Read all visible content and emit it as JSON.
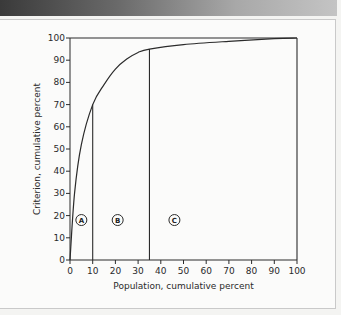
{
  "chart_data": {
    "type": "line",
    "title": "",
    "xlabel": "Population, cumulative percent",
    "ylabel": "Criterion, cumulative percent",
    "xlim": [
      0,
      100
    ],
    "ylim": [
      0,
      100
    ],
    "x_ticks": [
      0,
      10,
      20,
      30,
      40,
      50,
      60,
      70,
      80,
      90,
      100
    ],
    "y_ticks": [
      0,
      10,
      20,
      30,
      40,
      50,
      60,
      70,
      80,
      90,
      100
    ],
    "grid": false,
    "legend": "none",
    "series": [
      {
        "name": "Cumulative criterion curve",
        "x": [
          0,
          2,
          5,
          10,
          15,
          20,
          25,
          30,
          35,
          50,
          70,
          90,
          100
        ],
        "y": [
          0,
          30,
          52,
          70,
          79,
          86,
          90.5,
          93.5,
          95,
          97,
          98.5,
          99.7,
          100
        ]
      }
    ],
    "reference_lines": [
      {
        "type": "vertical",
        "x": 10,
        "y_top": 70
      },
      {
        "type": "vertical",
        "x": 35,
        "y_top": 95
      },
      {
        "type": "horizontal",
        "y": 100,
        "x_from": 0,
        "x_to": 100
      },
      {
        "type": "vertical",
        "x": 100,
        "y_from": 0,
        "y_to": 100
      }
    ],
    "annotations": [
      {
        "label": "A",
        "x": 5,
        "y": 18,
        "shape": "circle"
      },
      {
        "label": "B",
        "x": 21,
        "y": 18,
        "shape": "circle"
      },
      {
        "label": "C",
        "x": 46,
        "y": 18,
        "shape": "circle"
      }
    ]
  },
  "labels": {
    "xlabel": "Population, cumulative percent",
    "ylabel": "Criterion, cumulative percent",
    "region_a": "A",
    "region_b": "B",
    "region_c": "C",
    "x_ticks": [
      "0",
      "10",
      "20",
      "30",
      "40",
      "50",
      "60",
      "70",
      "80",
      "90",
      "100"
    ],
    "y_ticks": [
      "0",
      "10",
      "20",
      "30",
      "40",
      "50",
      "60",
      "70",
      "80",
      "90",
      "100"
    ]
  }
}
